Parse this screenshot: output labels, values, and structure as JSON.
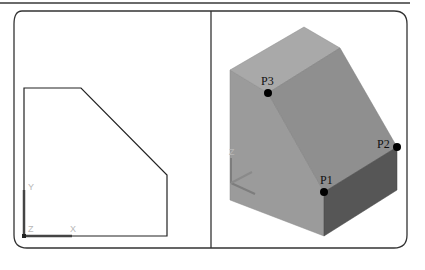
{
  "figure": {
    "left_view": {
      "title": "2D profile view",
      "ucs": {
        "x_label": "X",
        "y_label": "Y",
        "z_label": "Z"
      }
    },
    "right_view": {
      "title": "3D isometric view",
      "ucs": {
        "z_label": "Z"
      },
      "points": [
        {
          "id": "P1",
          "label": "P1"
        },
        {
          "id": "P2",
          "label": "P2"
        },
        {
          "id": "P3",
          "label": "P3"
        }
      ]
    },
    "colors": {
      "frame": "#333333",
      "top_face": "#a8a8a8",
      "left_face": "#9a9a9a",
      "slant_face": "#8c8c8c",
      "right_face": "#555555",
      "point": "#000000"
    }
  }
}
